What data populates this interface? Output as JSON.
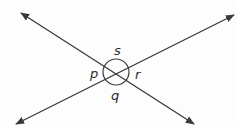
{
  "diagram": {
    "colors": {
      "line": "#3a3a3a",
      "label": "#2a2a2a",
      "background": "#fdfdfd"
    },
    "lines": [
      {
        "name": "line-a",
        "from": [
          21,
          13
        ],
        "to": [
          194,
          124
        ],
        "arrows": "both"
      },
      {
        "name": "line-b",
        "from": [
          16,
          124
        ],
        "to": [
          234,
          15
        ],
        "arrows": "both"
      }
    ],
    "intersection": [
      116,
      72
    ],
    "angle_circle_radius": 13,
    "labels": {
      "s": "s",
      "p": "p",
      "r": "r",
      "q": "q"
    }
  }
}
